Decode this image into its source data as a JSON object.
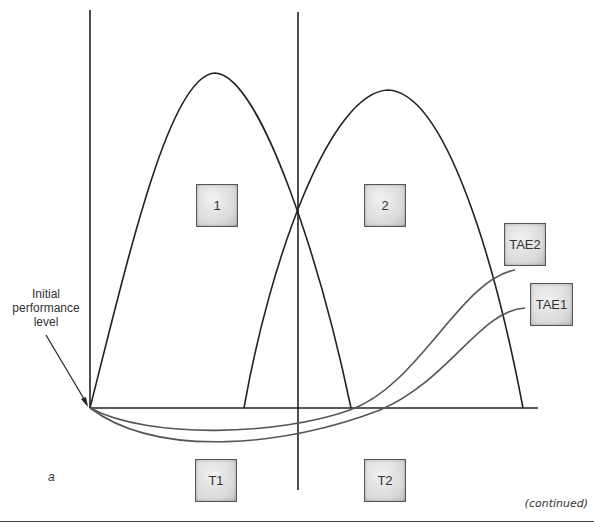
{
  "diagram": {
    "phase_boxes": [
      {
        "id": "1",
        "label": "1"
      },
      {
        "id": "2",
        "label": "2"
      }
    ],
    "trend_boxes": [
      {
        "id": "TAE2",
        "label": "TAE2"
      },
      {
        "id": "TAE1",
        "label": "TAE1"
      }
    ],
    "period_boxes": [
      {
        "id": "T1",
        "label": "T1"
      },
      {
        "id": "T2",
        "label": "T2"
      }
    ],
    "annotation": {
      "line1": "Initial",
      "line2": "performance",
      "line3": "level"
    },
    "panel_label": "a",
    "continued_note": "(continued)",
    "colors": {
      "axis": "#222222",
      "curve": "#222222",
      "trend_curve": "#555555",
      "box_border": "#555555"
    }
  }
}
